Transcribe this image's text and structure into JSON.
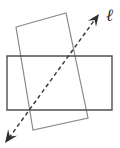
{
  "figure": {
    "background_color": "#ffffff",
    "width": 120,
    "height": 148,
    "label": {
      "text": "ℓ",
      "name": "line-label-ell",
      "x": 106,
      "y": 7,
      "color": "#2b2b2b"
    },
    "shapes": {
      "axis_rectangle": {
        "name": "horizontal-rectangle",
        "stroke": "#4f4f4f",
        "stroke_width": 1.4,
        "fill": "none",
        "points": "7,56 112,56 112,110 7,110"
      },
      "tilted_rectangle": {
        "name": "tilted-rectangle",
        "stroke": "#8a8a8a",
        "stroke_width": 1.2,
        "fill": "none",
        "points": "16,27 66,13 88,118 33,130"
      },
      "dashed_line": {
        "name": "dashed-transversal-line",
        "stroke": "#3a3a3a",
        "stroke_width": 1.5,
        "dash_pattern": "4 3",
        "x1": 9,
        "y1": 138,
        "x2": 96,
        "y2": 18
      },
      "arrowhead_upper": {
        "name": "arrowhead-upper-right",
        "fill": "#2e2e2e",
        "tip_x": 99,
        "tip_y": 14
      },
      "arrowhead_lower": {
        "name": "arrowhead-lower-left",
        "fill": "#2e2e2e",
        "tip_x": 5,
        "tip_y": 143
      }
    }
  },
  "chart_data": {
    "type": "diagram",
    "elements": [
      {
        "kind": "rectangle",
        "name": "horizontal-rectangle",
        "orientation": "axis-aligned",
        "corners": [
          [
            7,
            56
          ],
          [
            112,
            56
          ],
          [
            112,
            110
          ],
          [
            7,
            110
          ]
        ],
        "width": 105,
        "height": 54,
        "stroke": "#4f4f4f"
      },
      {
        "kind": "rectangle",
        "name": "tilted-rectangle",
        "orientation": "rotated",
        "rotation_deg": -16,
        "corners": [
          [
            16,
            27
          ],
          [
            66,
            13
          ],
          [
            88,
            118
          ],
          [
            33,
            130
          ]
        ],
        "stroke": "#8a8a8a"
      },
      {
        "kind": "line",
        "name": "dashed-transversal-line",
        "label": "ℓ",
        "style": "dashed",
        "arrows": "both",
        "from": [
          5,
          143
        ],
        "to": [
          99,
          14
        ],
        "stroke": "#3a3a3a"
      }
    ],
    "annotations": [
      "ℓ"
    ],
    "grid": false,
    "legend": false
  }
}
